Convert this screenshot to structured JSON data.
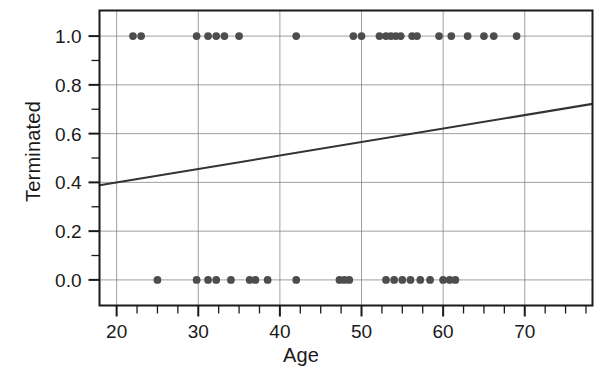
{
  "chart_data": {
    "type": "scatter",
    "title": "",
    "xlabel": "Age",
    "ylabel": "Terminated",
    "xlim": [
      17.9,
      78.3
    ],
    "ylim": [
      -0.105,
      1.105
    ],
    "xticks": [
      20,
      30,
      40,
      50,
      60,
      70
    ],
    "xtick_labels": [
      "20",
      "30",
      "40",
      "50",
      "60",
      "70"
    ],
    "xminor_step": 2.5,
    "yticks": [
      0.0,
      0.2,
      0.4,
      0.6,
      0.8,
      1.0
    ],
    "ytick_labels": [
      "0.0",
      "0.2",
      "0.4",
      "0.6",
      "0.8",
      "1.0"
    ],
    "yminor_step": 0.1,
    "grid": true,
    "grid_color": "#808080",
    "legend": "none",
    "marker": "filled-circle",
    "marker_color": "#4d4d4d",
    "marker_size": 6,
    "line_color": "#333333",
    "frame_color": "#1a1a1a",
    "series": [
      {
        "name": "Terminated vs Age",
        "x": [
          22.0,
          23.0,
          29.8,
          31.2,
          32.2,
          33.2,
          35.0,
          42.0,
          49.0,
          50.0,
          52.2,
          53.0,
          53.6,
          54.2,
          54.8,
          56.2,
          56.8,
          59.5,
          61.0,
          63.0,
          65.0,
          66.2,
          69.0
        ],
        "y": [
          1,
          1,
          1,
          1,
          1,
          1,
          1,
          1,
          1,
          1,
          1,
          1,
          1,
          1,
          1,
          1,
          1,
          1,
          1,
          1,
          1,
          1,
          1
        ]
      },
      {
        "name": "Not terminated vs Age",
        "x": [
          25.0,
          29.8,
          31.2,
          32.2,
          34.0,
          36.3,
          37.0,
          38.5,
          42.0,
          47.3,
          47.9,
          48.5,
          53.0,
          54.0,
          55.0,
          56.0,
          57.2,
          58.4,
          60.0,
          60.8,
          61.5
        ],
        "y": [
          0,
          0,
          0,
          0,
          0,
          0,
          0,
          0,
          0,
          0,
          0,
          0,
          0,
          0,
          0,
          0,
          0,
          0,
          0,
          0,
          0
        ]
      }
    ],
    "fit_line": {
      "type": "linear-regression",
      "x_start": 17.9,
      "y_start": 0.388,
      "x_end": 78.3,
      "y_end": 0.722,
      "slope": 0.00553,
      "intercept": 0.289
    }
  }
}
